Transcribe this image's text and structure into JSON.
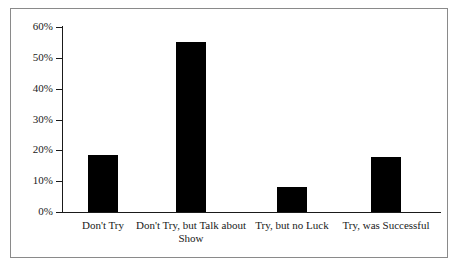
{
  "chart_data": {
    "type": "bar",
    "title": "",
    "xlabel": "",
    "ylabel": "",
    "categories": [
      "Don't Try",
      "Don't Try, but Talk about Show",
      "Try, but no Luck",
      "Try, was Successful"
    ],
    "values": [
      18.5,
      55,
      8,
      18
    ],
    "value_labels": [
      "18.5%",
      "55%",
      "8%",
      "18%"
    ],
    "ylim": [
      0,
      60
    ],
    "ytick_values": [
      0,
      10,
      20,
      30,
      40,
      50,
      60
    ],
    "ytick_labels": [
      "0%",
      "10%",
      "20%",
      "30%",
      "40%",
      "50%",
      "60%"
    ],
    "grid": false,
    "legend": null,
    "bar_color": "#000000",
    "axis_color": "#1a1a1a",
    "frame_color": "#8a8a8a",
    "background": "#ffffff"
  }
}
